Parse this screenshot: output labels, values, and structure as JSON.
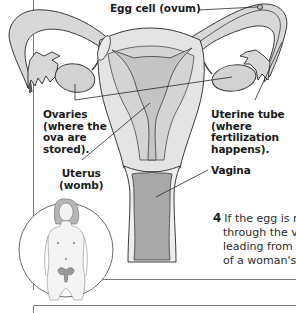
{
  "figure": {
    "labels": {
      "egg_cell": "Egg cell (ovum)",
      "ovaries": [
        "Ovaries",
        "(where the",
        "ova are",
        "stored)."
      ],
      "uterine_tube": [
        "Uterine tube",
        "(where",
        "fertilization",
        "happens)."
      ],
      "uterus": [
        "Uterus",
        "(womb)"
      ],
      "vagina": "Vagina"
    },
    "inset": "full-body-figure-with-highlighted-reproductive-organs"
  },
  "caption": {
    "step_number": "4",
    "lines": [
      "If the egg is r",
      "through the v",
      "leading from",
      "of a woman's"
    ]
  },
  "colors": {
    "organ_fill": "#d6d6d6",
    "organ_light": "#e6e6e6",
    "cavity_fill": "#a9a9a9",
    "outline": "#3a3a3a",
    "text": "#1a1a1a",
    "border": "#7a7a7a"
  }
}
